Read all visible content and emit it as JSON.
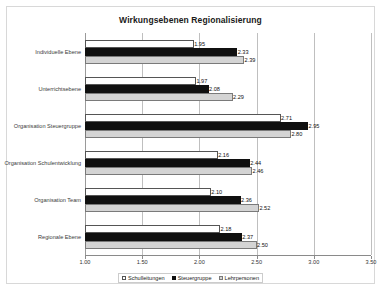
{
  "chart_data": {
    "type": "bar",
    "orientation": "horizontal",
    "title": "Wirkungsebenen Regionalisierung",
    "xlabel": "",
    "ylabel": "",
    "xlim": [
      1.0,
      3.5
    ],
    "xticks": [
      "1.00",
      "1.50",
      "2.00",
      "2.50",
      "3.00",
      "3.50"
    ],
    "xtick_values": [
      1.0,
      1.5,
      2.0,
      2.5,
      3.0,
      3.5
    ],
    "grid": true,
    "legend_position": "bottom",
    "categories": [
      "Individuelle Ebene",
      "Unterrichtsebene",
      "Organisation Steuergruppe",
      "Organisation Schulentwicklung",
      "Organisation Team",
      "Regionale Ebene"
    ],
    "series": [
      {
        "name": "Schulleitungen",
        "color": "#ffffff",
        "values": [
          1.95,
          1.97,
          2.71,
          2.16,
          2.1,
          2.18
        ],
        "labels": [
          "1.95",
          "1.97",
          "2.71",
          "2.16",
          "2.10",
          "2.18"
        ]
      },
      {
        "name": "Steuergruppe",
        "color": "#101010",
        "values": [
          2.33,
          2.08,
          2.95,
          2.44,
          2.36,
          2.37
        ],
        "labels": [
          "2.33",
          "2.08",
          "2.95",
          "2.44",
          "2.36",
          "2.37"
        ]
      },
      {
        "name": "Lehrpersonen",
        "color": "#d4d4d4",
        "values": [
          2.39,
          2.29,
          2.8,
          2.46,
          2.52,
          2.5
        ],
        "labels": [
          "2.39",
          "2.29",
          "2.80",
          "2.46",
          "2.52",
          "2.50"
        ]
      }
    ]
  }
}
